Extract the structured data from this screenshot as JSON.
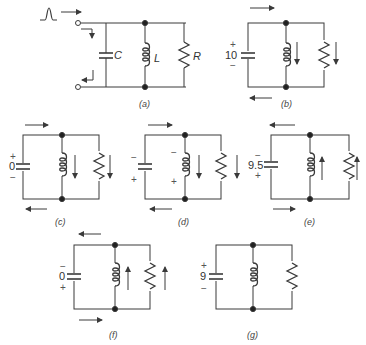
{
  "figure": {
    "panels": [
      {
        "id": "a",
        "caption": "(a)",
        "labels": {
          "capacitor": "C",
          "inductor": "L",
          "resistor": "R"
        }
      },
      {
        "id": "b",
        "caption": "(b)",
        "cap_voltage": "10",
        "top_sign": "+",
        "bottom_sign": "−"
      },
      {
        "id": "c",
        "caption": "(c)",
        "cap_voltage": "0",
        "top_sign": "+",
        "bottom_sign": "−"
      },
      {
        "id": "d",
        "caption": "(d)",
        "cap_top_sign": "−",
        "cap_bottom_sign": "+",
        "ind_top_sign": "−",
        "ind_bottom_sign": "+"
      },
      {
        "id": "e",
        "caption": "(e)",
        "cap_voltage": "9.5",
        "top_sign": "−",
        "bottom_sign": "+"
      },
      {
        "id": "f",
        "caption": "(f)",
        "cap_voltage": "0",
        "top_sign": "−",
        "bottom_sign": "+"
      },
      {
        "id": "g",
        "caption": "(g)",
        "cap_voltage": "9",
        "top_sign": "+",
        "bottom_sign": "−"
      }
    ],
    "colors": {
      "line": "#3a3a3a",
      "background": "#ffffff"
    }
  }
}
